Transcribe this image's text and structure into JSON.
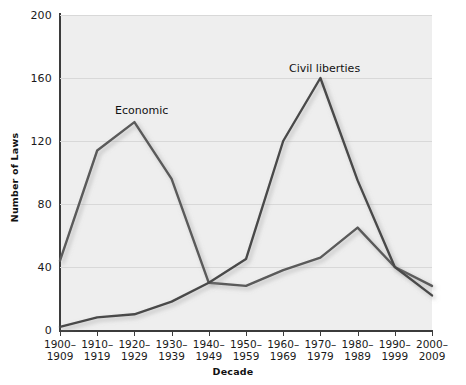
{
  "chart_data": {
    "type": "line",
    "title": "",
    "xlabel": "Decade",
    "ylabel": "Number of Laws",
    "ylim": [
      0,
      200
    ],
    "yticks": [
      0,
      40,
      80,
      120,
      160,
      200
    ],
    "grid": true,
    "legend_position": "inline-annotation",
    "categories": [
      "1900–\n1909",
      "1910–\n1919",
      "1920–\n1929",
      "1930–\n1939",
      "1940–\n1949",
      "1950–\n1959",
      "1960–\n1969",
      "1970–\n1979",
      "1980–\n1989",
      "1990–\n1999",
      "2000–\n2009"
    ],
    "series": [
      {
        "name": "Economic",
        "color": "#5a5a5a",
        "values": [
          44,
          114,
          132,
          96,
          30,
          28,
          38,
          46,
          65,
          40,
          28
        ]
      },
      {
        "name": "Civil liberties",
        "color": "#4a4a4a",
        "values": [
          2,
          8,
          10,
          18,
          30,
          45,
          120,
          160,
          95,
          40,
          22
        ]
      }
    ],
    "annotations": [
      {
        "text": "Economic",
        "series": "Economic"
      },
      {
        "text": "Civil liberties",
        "series": "Civil liberties"
      }
    ]
  },
  "axes": {
    "y_title": "Number of Laws",
    "x_title": "Decade",
    "y_tick_labels": [
      "0",
      "40",
      "80",
      "120",
      "160",
      "200"
    ],
    "x_tick_labels": [
      "1900–\n1909",
      "1910–\n1919",
      "1920–\n1929",
      "1930–\n1939",
      "1940–\n1949",
      "1950–\n1959",
      "1960–\n1969",
      "1970–\n1979",
      "1980–\n1989",
      "1990–\n1999",
      "2000–\n2009"
    ]
  },
  "labels": {
    "economic": "Economic",
    "civil_liberties": "Civil liberties"
  },
  "colors": {
    "plot_background": "#eeeeee",
    "grid": "#d8d8d8",
    "axis": "#3b3b3b",
    "economic_line": "#5a5a5a",
    "civil_line": "#4a4a4a",
    "text": "#1a1a1a"
  }
}
